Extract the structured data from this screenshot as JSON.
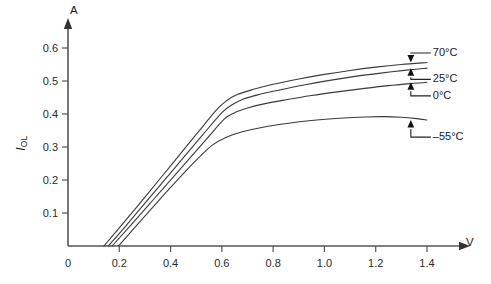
{
  "chart_data": {
    "type": "line",
    "title": "",
    "xlabel": "V",
    "ylabel": "I_OL",
    "ylabel_main": "I",
    "ylabel_sub": "OL",
    "xlim": [
      0,
      1.5
    ],
    "ylim": [
      0,
      0.66
    ],
    "grid": false,
    "legend_position": "right-inline-annotations",
    "x_ticks": [
      0,
      0.2,
      0.4,
      0.6,
      0.8,
      1.0,
      1.2,
      1.4
    ],
    "x_tick_labels": [
      "0",
      "0.2",
      "0.4",
      "0.6",
      "0.8",
      "1.0",
      "1.2",
      "1.4"
    ],
    "y_ticks": [
      0.1,
      0.2,
      0.3,
      0.4,
      0.5,
      0.6
    ],
    "y_tick_labels": [
      "0.1",
      "0.2",
      "0.3",
      "0.4",
      "0.5",
      "0.6"
    ],
    "axis_unit_y": "A",
    "axis_unit_x": "V",
    "series": [
      {
        "name": "70°C",
        "label": "70°C",
        "arrow_direction": "down",
        "points": [
          [
            0.14,
            0.0
          ],
          [
            0.2,
            0.055
          ],
          [
            0.3,
            0.148
          ],
          [
            0.4,
            0.243
          ],
          [
            0.5,
            0.338
          ],
          [
            0.58,
            0.413
          ],
          [
            0.62,
            0.441
          ],
          [
            0.66,
            0.459
          ],
          [
            0.72,
            0.474
          ],
          [
            0.8,
            0.49
          ],
          [
            0.9,
            0.506
          ],
          [
            1.0,
            0.52
          ],
          [
            1.1,
            0.532
          ],
          [
            1.2,
            0.542
          ],
          [
            1.3,
            0.55
          ],
          [
            1.4,
            0.556
          ]
        ]
      },
      {
        "name": "25°C",
        "label": "25°C",
        "arrow_direction": "up",
        "points": [
          [
            0.157,
            0.0
          ],
          [
            0.22,
            0.056
          ],
          [
            0.32,
            0.148
          ],
          [
            0.42,
            0.24
          ],
          [
            0.52,
            0.332
          ],
          [
            0.6,
            0.404
          ],
          [
            0.64,
            0.428
          ],
          [
            0.68,
            0.444
          ],
          [
            0.74,
            0.458
          ],
          [
            0.82,
            0.472
          ],
          [
            0.92,
            0.488
          ],
          [
            1.02,
            0.502
          ],
          [
            1.12,
            0.514
          ],
          [
            1.22,
            0.524
          ],
          [
            1.32,
            0.533
          ],
          [
            1.4,
            0.539
          ]
        ]
      },
      {
        "name": "0°C",
        "label": "0°C",
        "arrow_direction": "up",
        "points": [
          [
            0.172,
            0.0
          ],
          [
            0.24,
            0.059
          ],
          [
            0.34,
            0.147
          ],
          [
            0.44,
            0.235
          ],
          [
            0.54,
            0.324
          ],
          [
            0.61,
            0.385
          ],
          [
            0.65,
            0.404
          ],
          [
            0.7,
            0.418
          ],
          [
            0.76,
            0.43
          ],
          [
            0.85,
            0.443
          ],
          [
            0.95,
            0.456
          ],
          [
            1.05,
            0.467
          ],
          [
            1.15,
            0.477
          ],
          [
            1.25,
            0.486
          ],
          [
            1.35,
            0.493
          ],
          [
            1.4,
            0.496
          ]
        ]
      },
      {
        "name": "-55°C",
        "label": "–55°C",
        "arrow_direction": "up",
        "points": [
          [
            0.197,
            0.0
          ],
          [
            0.26,
            0.056
          ],
          [
            0.36,
            0.143
          ],
          [
            0.46,
            0.228
          ],
          [
            0.56,
            0.304
          ],
          [
            0.62,
            0.33
          ],
          [
            0.68,
            0.346
          ],
          [
            0.76,
            0.36
          ],
          [
            0.86,
            0.372
          ],
          [
            0.96,
            0.381
          ],
          [
            1.06,
            0.387
          ],
          [
            1.16,
            0.391
          ],
          [
            1.23,
            0.392
          ],
          [
            1.3,
            0.39
          ],
          [
            1.36,
            0.386
          ],
          [
            1.4,
            0.382
          ]
        ]
      }
    ],
    "annotations": [
      {
        "label": "70°C",
        "x": 1.415,
        "y": 0.585,
        "arrow_to_y": 0.556,
        "direction": "down"
      },
      {
        "label": "25°C",
        "x": 1.415,
        "y": 0.505,
        "arrow_to_y": 0.539,
        "direction": "up"
      },
      {
        "label": "0°C",
        "x": 1.415,
        "y": 0.455,
        "arrow_to_y": 0.496,
        "direction": "up"
      },
      {
        "label": "–55°C",
        "x": 1.415,
        "y": 0.33,
        "arrow_to_y": 0.382,
        "direction": "up"
      }
    ],
    "colors": {
      "curve": "#3a3a3a",
      "axis": "#555555",
      "text": "#1a1a1a",
      "background": "#ffffff"
    }
  }
}
